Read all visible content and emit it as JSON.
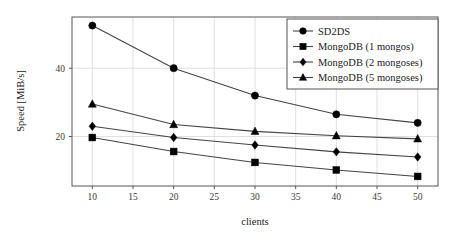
{
  "chart_data": {
    "type": "line",
    "title": "",
    "xlabel": "clients",
    "ylabel": "Speed [MiB/s]",
    "x": [
      10,
      20,
      30,
      40,
      50
    ],
    "xlim": [
      7.5,
      52.5
    ],
    "ylim": [
      5.5,
      55
    ],
    "xticks": [
      10,
      15,
      20,
      25,
      30,
      35,
      40,
      45,
      50
    ],
    "xtick_labels": [
      "10",
      "15",
      "20",
      "25",
      "30",
      "35",
      "40",
      "45",
      "50"
    ],
    "yticks": [
      20,
      40
    ],
    "ytick_labels": [
      "20",
      "40"
    ],
    "grid": true,
    "legend_position": "top-right",
    "series": [
      {
        "name": "SD2DS",
        "marker": "circle",
        "values": [
          52.5,
          40.0,
          32.0,
          26.5,
          24.0
        ]
      },
      {
        "name": "MongoDB (1 mongos)",
        "marker": "square",
        "values": [
          19.7,
          15.6,
          12.4,
          10.2,
          8.3
        ]
      },
      {
        "name": "MongoDB (2 mongoses)",
        "marker": "diamond",
        "values": [
          23.0,
          19.7,
          17.5,
          15.5,
          14.0
        ]
      },
      {
        "name": "MongoDB (5 mongoses)",
        "marker": "triangle",
        "values": [
          29.5,
          23.5,
          21.5,
          20.2,
          19.3
        ]
      }
    ]
  },
  "colors": {
    "line": "#444444",
    "marker": "#000000",
    "grid": "#d8d8d8",
    "frame": "#555555",
    "background": "#ffffff"
  }
}
